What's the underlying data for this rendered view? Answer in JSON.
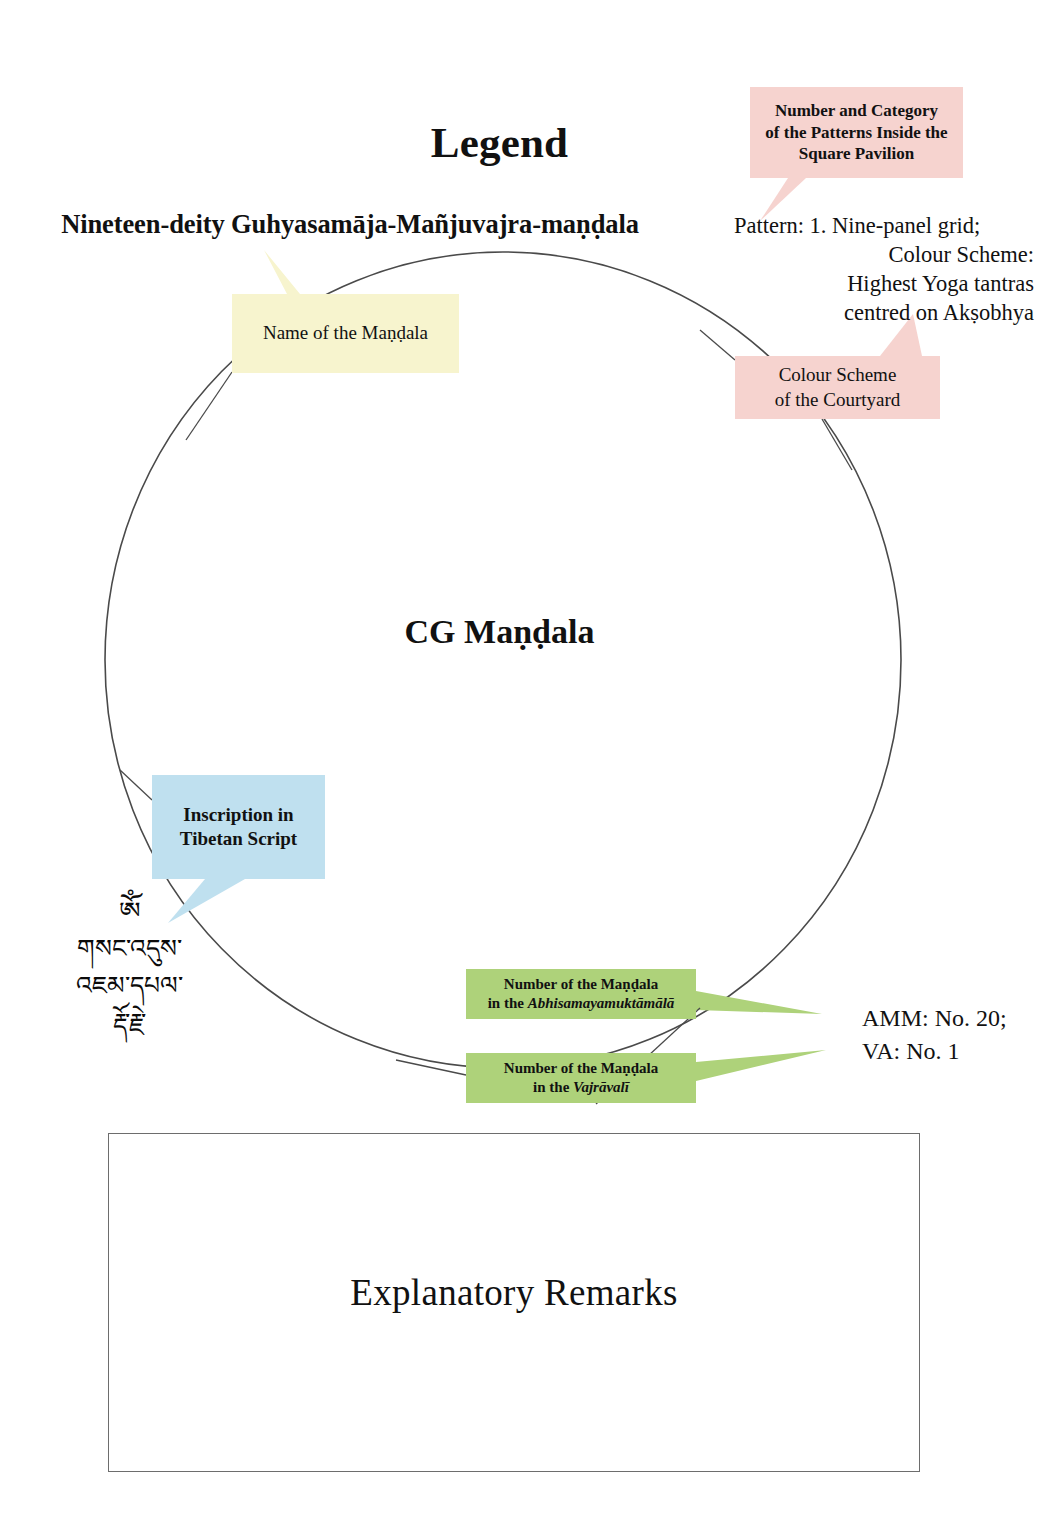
{
  "page": {
    "legend_title": "Legend",
    "mandala_name": "Nineteen-deity Guhyasamāja-Mañjuvajra-maṇḍala",
    "center_label": "CG Maṇḍala",
    "remarks_label": "Explanatory Remarks"
  },
  "callouts": {
    "name_of_mandala": {
      "label": "Name of the Maṇḍala",
      "color": "#f7f4ce"
    },
    "patterns_inside_pavilion": {
      "line1": "Number and Category",
      "line2": "of the Patterns Inside the",
      "line3": "Square Pavilion",
      "color": "#f6d3cf"
    },
    "colour_scheme_courtyard": {
      "line1": "Colour Scheme",
      "line2": "of the Courtyard",
      "color": "#f6d3cf"
    },
    "inscription_tibetan": {
      "line1": "Inscription in",
      "line2": "Tibetan Script",
      "color": "#bfe0ef"
    },
    "number_in_amm": {
      "line1": "Number of the Maṇḍala",
      "line2_prefix": "in the ",
      "line2_title": "Abhisamayamuktāmālā",
      "color": "#aed27a"
    },
    "number_in_va": {
      "line1": "Number of the Maṇḍala",
      "line2_prefix": "in the ",
      "line2_title": "Vajrāvalī",
      "color": "#aed27a"
    }
  },
  "pattern_block": {
    "line1": "Pattern: 1. Nine-panel grid;",
    "line2": "Colour Scheme:",
    "line3": "Highest Yoga tantras",
    "line4": "centred on Akṣobhya"
  },
  "number_block": {
    "line1": "AMM: No. 20;",
    "line2": "VA: No. 1"
  },
  "tibetan_inscription": {
    "line1": "ༀ",
    "line2": "གསང་འདུས་",
    "line3": "འཇམ་དཔལ་",
    "line4": "རྡོ་རྗེ་"
  },
  "colors": {
    "yellow_callout": "#f7f4ce",
    "pink_callout": "#f6d3cf",
    "blue_callout": "#bfe0ef",
    "green_callout": "#aed27a",
    "line": "#444444",
    "text": "#111111",
    "background": "#ffffff"
  }
}
